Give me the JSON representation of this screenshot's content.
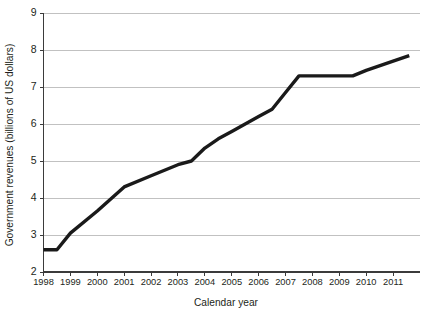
{
  "chart_data": {
    "type": "line",
    "title": "",
    "xlabel": "Calendar year",
    "ylabel": "Government revenues (billions of US dollars)",
    "xlim": [
      1998,
      2012
    ],
    "ylim": [
      2,
      9
    ],
    "grid": true,
    "legend": false,
    "x_tick_labels": [
      "1998",
      "1999",
      "2000",
      "2001",
      "2002",
      "2003",
      "2004",
      "2005",
      "2006",
      "2007",
      "2008",
      "2009",
      "2010",
      "2011"
    ],
    "x_ticks": [
      1998,
      1999,
      2000,
      2001,
      2002,
      2003,
      2004,
      2005,
      2006,
      2007,
      2008,
      2009,
      2010,
      2011
    ],
    "y_tick_labels": [
      "2",
      "3",
      "4",
      "5",
      "6",
      "7",
      "8",
      "9"
    ],
    "y_ticks": [
      2,
      3,
      4,
      5,
      6,
      7,
      8,
      9
    ],
    "series": [
      {
        "name": "Government revenues",
        "color": "#1a1a1a",
        "x": [
          1998.0,
          1998.5,
          1999.0,
          2000.0,
          2001.0,
          2002.0,
          2002.5,
          2003.0,
          2003.5,
          2004.0,
          2004.5,
          2005.0,
          2006.0,
          2006.5,
          2007.0,
          2007.5,
          2008.0,
          2009.0,
          2009.5,
          2010.0,
          2011.0,
          2011.6
        ],
        "values": [
          2.6,
          2.6,
          3.05,
          3.65,
          4.3,
          4.6,
          4.75,
          4.9,
          5.0,
          5.35,
          5.6,
          5.8,
          6.2,
          6.4,
          6.85,
          7.3,
          7.3,
          7.3,
          7.3,
          7.45,
          7.7,
          7.85
        ]
      }
    ],
    "annotations": []
  },
  "figure": {
    "background": "#ffffff",
    "gridline_color": "#a7a7a7",
    "axis_color": "#3b3b3b"
  }
}
